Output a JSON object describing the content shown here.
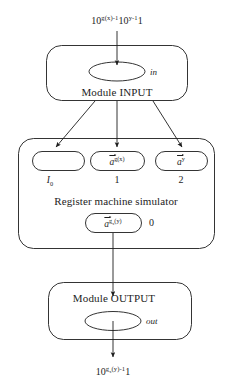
{
  "diagram": {
    "stroke_color": "#1d1d1d",
    "background_color": "#ffffff",
    "input_expression": {
      "base1": "10",
      "exponent1": "g(x)-1",
      "base2": "10",
      "exponent2": "y-1",
      "trailing": "1",
      "plain": "10^{g(x)-1}10^{y-1}1"
    },
    "output_expression": {
      "base": "10",
      "exponent_main": "g",
      "exponent_sub": "x",
      "exponent_arg": "(y)-1",
      "trailing": "1",
      "plain": "10^{g_x(y)-1}1"
    },
    "input_module": {
      "label": "Module INPUT",
      "port_label": "in"
    },
    "output_module": {
      "label": "Module OUTPUT",
      "port_label": "out"
    },
    "simulator": {
      "label": "Register machine simulator",
      "registers": [
        {
          "content": "",
          "content_plain": "",
          "index_label": "I",
          "index_sub": "0",
          "index_plain": "I0",
          "index_italic": true
        },
        {
          "content_vec": "a",
          "content_sup": "g(x)",
          "content_plain": "a⃗^{g(x)}",
          "index_label": "1",
          "index_plain": "1",
          "index_italic": false
        },
        {
          "content_vec": "a",
          "content_sup": "y",
          "content_plain": "a⃗^{y}",
          "index_label": "2",
          "index_plain": "2",
          "index_italic": false
        }
      ],
      "result_register": {
        "content_vec": "a",
        "content_sup_main": "g",
        "content_sup_sub": "x",
        "content_sup_arg": "(y)",
        "content_plain": "a⃗^{g_x(y)}",
        "index_label": "0"
      }
    }
  }
}
